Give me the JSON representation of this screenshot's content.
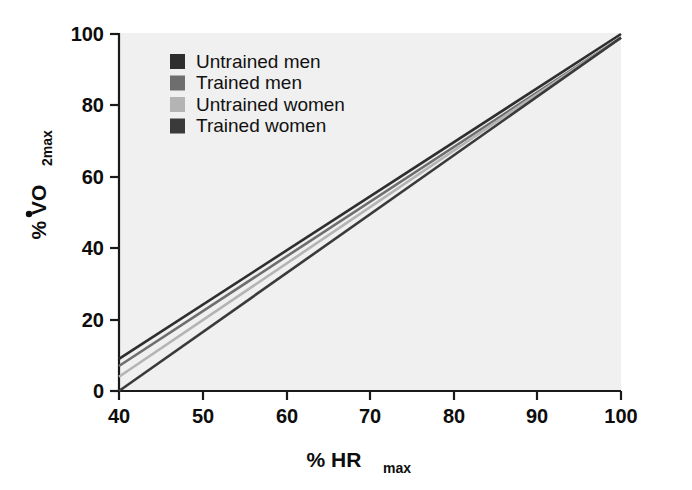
{
  "chart_data": {
    "type": "line",
    "title": "",
    "xlabel": "% HRmax",
    "xlabel_main": "% HR",
    "xlabel_sub": "max",
    "ylabel": "% VO2max",
    "ylabel_main": "% VO",
    "ylabel_sub": "2max",
    "xlim": [
      40,
      100
    ],
    "ylim": [
      0,
      100
    ],
    "xticks": [
      40,
      50,
      60,
      70,
      80,
      90,
      100
    ],
    "xticklabels": [
      "40",
      "50",
      "60",
      "70",
      "80",
      "90",
      "100"
    ],
    "yticks": [
      0,
      20,
      40,
      60,
      80,
      100
    ],
    "yticklabels": [
      "0",
      "20",
      "40",
      "60",
      "80",
      "100"
    ],
    "grid": false,
    "legend_position": "upper left",
    "plot_background": "#f0f0f0",
    "axis_color": "#1a1a1a",
    "series": [
      {
        "name": "Untrained men",
        "color": "#2e2e2e",
        "x": [
          40,
          100
        ],
        "values": [
          9,
          100
        ],
        "slope": 1.517,
        "intercept": -51.67
      },
      {
        "name": "Trained men",
        "color": "#6e6e6e",
        "x": [
          40,
          100
        ],
        "values": [
          7,
          99
        ],
        "slope": 1.533,
        "intercept": -54.33
      },
      {
        "name": "Untrained women",
        "color": "#b4b4b4",
        "x": [
          40,
          100
        ],
        "values": [
          4,
          99
        ],
        "slope": 1.583,
        "intercept": -59.33
      },
      {
        "name": "Trained women",
        "color": "#3a3a3a",
        "x": [
          40,
          100
        ],
        "values": [
          0,
          99
        ],
        "slope": 1.65,
        "intercept": -66.0
      }
    ]
  },
  "legend": {
    "items": [
      {
        "label": "Untrained men",
        "swatch_color": "#2e2e2e"
      },
      {
        "label": "Trained men",
        "swatch_color": "#6e6e6e"
      },
      {
        "label": "Untrained women",
        "swatch_color": "#b4b4b4"
      },
      {
        "label": "Trained women",
        "swatch_color": "#3a3a3a"
      }
    ]
  },
  "axes": {
    "x": {
      "label_main": "% HR",
      "label_sub": "max",
      "ticks": [
        "40",
        "50",
        "60",
        "70",
        "80",
        "90",
        "100"
      ]
    },
    "y": {
      "label_main": "% VO",
      "label_sub": "2max",
      "ticks": [
        "0",
        "20",
        "40",
        "60",
        "80",
        "100"
      ]
    }
  }
}
